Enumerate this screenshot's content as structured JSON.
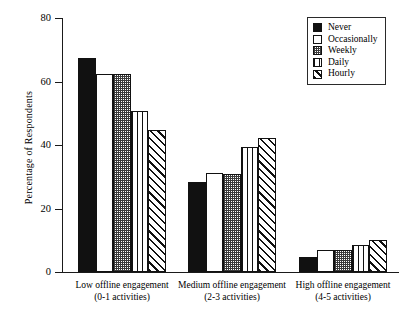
{
  "chart_data": {
    "type": "bar",
    "title": "",
    "xlabel": "",
    "ylabel": "Percentage of Respondents",
    "ylim": [
      0,
      80
    ],
    "yticks": [
      0,
      20,
      40,
      60,
      80
    ],
    "ytick_labels": [
      "0",
      "20",
      "40",
      "60",
      "80"
    ],
    "grid": false,
    "legend_position": "top-right",
    "categories": [
      "Low offline engagement",
      "Medium offline engagement",
      "High offline engagement"
    ],
    "category_sublabels": [
      "(0-1 activities)",
      "(2-3 activities)",
      "(4-5 activities)"
    ],
    "series": [
      {
        "name": "Never",
        "pattern": "solid-black",
        "values": [
          67.4,
          28.3,
          4.6
        ]
      },
      {
        "name": "Occasionally",
        "pattern": "open-white",
        "values": [
          62.4,
          31.2,
          6.8
        ]
      },
      {
        "name": "Weekly",
        "pattern": "stippled-dots",
        "values": [
          62.5,
          30.8,
          6.9
        ]
      },
      {
        "name": "Daily",
        "pattern": "vertical-lines",
        "values": [
          50.6,
          39.4,
          8.4
        ]
      },
      {
        "name": "Hourly",
        "pattern": "diagonal-hatch",
        "values": [
          44.6,
          42.3,
          10.2
        ]
      }
    ]
  },
  "legend": {
    "items": [
      {
        "label": "Never"
      },
      {
        "label": "Occasionally"
      },
      {
        "label": "Weekly"
      },
      {
        "label": "Daily"
      },
      {
        "label": "Hourly"
      }
    ]
  },
  "colors": {
    "axis": "#1a1a1a",
    "bar_outline": "#111111",
    "fill_solid": "#111111",
    "fill_open": "#ffffff",
    "background": "#ffffff"
  }
}
